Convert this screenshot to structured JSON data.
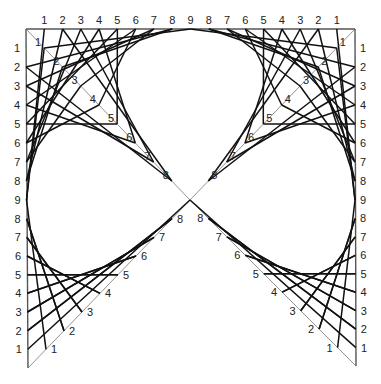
{
  "figure": {
    "title": "",
    "colors": {
      "line": "#111111",
      "axis": "#555555",
      "diagonal": "#777777",
      "background": "#ffffff",
      "text": "#222222"
    },
    "geometry": {
      "top_left_corner": [
        26,
        29
      ],
      "top_right_corner": [
        355,
        29
      ],
      "bottom_left_corner": [
        28,
        368
      ],
      "bottom_right_corner": [
        356,
        366
      ],
      "center": [
        190,
        200
      ]
    },
    "labels": {
      "top_axis": [
        "1",
        "2",
        "3",
        "4",
        "5",
        "6",
        "7",
        "8",
        "9",
        "8",
        "7",
        "6",
        "5",
        "4",
        "3",
        "2",
        "1"
      ],
      "left_axis": [
        "1",
        "2",
        "3",
        "4",
        "5",
        "6",
        "7",
        "8",
        "9",
        "8",
        "7",
        "6",
        "5",
        "4",
        "3",
        "2",
        "1"
      ],
      "right_axis": [
        "1",
        "2",
        "3",
        "4",
        "5",
        "6",
        "7",
        "8",
        "9",
        "8",
        "7",
        "6",
        "5",
        "4",
        "3",
        "2",
        "1"
      ],
      "diagonal_top_left": [
        "1",
        "2",
        "3",
        "4",
        "5",
        "6",
        "7",
        "8"
      ],
      "diagonal_top_right": [
        "1",
        "2",
        "3",
        "4",
        "5",
        "6",
        "7",
        "8"
      ],
      "diagonal_bottom_left": [
        "1",
        "2",
        "3",
        "4",
        "5",
        "6",
        "7",
        "8"
      ],
      "diagonal_bottom_right": [
        "1",
        "2",
        "3",
        "4",
        "5",
        "6",
        "7",
        "8"
      ]
    },
    "rule": "Point k on each diagonal connects to point (10-k) on the adjacent axes; axis point k connects to the other axis point (10-k)"
  }
}
